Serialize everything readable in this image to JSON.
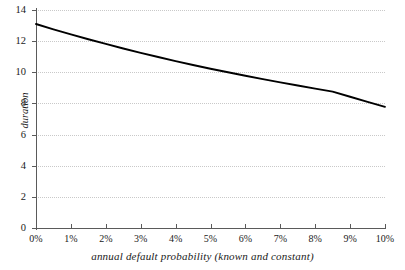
{
  "chart_data": {
    "type": "line",
    "title": "",
    "subtitle": "",
    "xlabel": "annual default probability (known and constant)",
    "ylabel": "duration",
    "xlim": [
      0,
      10
    ],
    "ylim": [
      0,
      14
    ],
    "grid": "horizontal-dotted",
    "legend": "none",
    "line_color": "#000000",
    "grid_color": "#c9c9c9",
    "axis_color": "#5a5a5a",
    "x_tick_labels": [
      "0%",
      "1%",
      "2%",
      "3%",
      "4%",
      "5%",
      "6%",
      "7%",
      "8%",
      "9%",
      "10%"
    ],
    "x_tick_values": [
      0,
      1,
      2,
      3,
      4,
      5,
      6,
      7,
      8,
      9,
      10
    ],
    "y_tick_labels": [
      "0",
      "2",
      "4",
      "6",
      "8",
      "10",
      "12",
      "14"
    ],
    "y_tick_values": [
      0,
      2,
      4,
      6,
      8,
      10,
      12,
      14
    ],
    "x": [
      0,
      0.5,
      1,
      1.5,
      2,
      2.5,
      3,
      3.5,
      4,
      4.5,
      5,
      5.5,
      6,
      6.5,
      7,
      7.5,
      8,
      8.5,
      9,
      9.5,
      10
    ],
    "series": [
      {
        "name": "duration",
        "values": [
          13.1,
          12.76,
          12.43,
          12.12,
          11.82,
          11.53,
          11.25,
          10.98,
          10.72,
          10.47,
          10.23,
          10.0,
          9.78,
          9.56,
          9.35,
          9.15,
          8.95,
          8.76,
          8.43,
          8.1,
          7.78
        ]
      }
    ],
    "annotations": []
  }
}
